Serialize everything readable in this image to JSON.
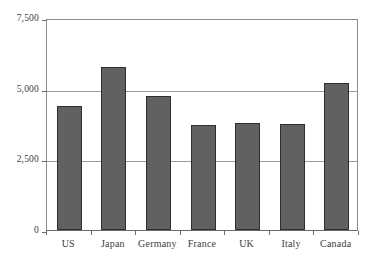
{
  "chart_data": {
    "type": "bar",
    "title": "",
    "subtitle": "",
    "xlabel": "",
    "ylabel": "",
    "categories": [
      "US",
      "Japan",
      "Germany",
      "France",
      "UK",
      "Italy",
      "Canada"
    ],
    "values": [
      4400,
      5750,
      4750,
      3700,
      3800,
      3750,
      5200
    ],
    "series": [
      {
        "name": "",
        "values": [
          4400,
          5750,
          4750,
          3700,
          3800,
          3750,
          5200
        ]
      }
    ],
    "ylim": [
      0,
      7500
    ],
    "yticks": [
      0,
      2500,
      5000,
      7500
    ],
    "ytick_labels": [
      "0",
      "2,500",
      "5,000",
      "7,500"
    ],
    "grid": true,
    "grid_axis": "y",
    "legend": false,
    "legend_position": "none",
    "bar_color": "#616161",
    "bar_border_color": "#2e2e2e",
    "gridline_color": "#9a9a9a",
    "axis_color": "#6a6a6a",
    "text_color": "#3d3d3d",
    "background_color": "#ffffff",
    "annotations": []
  }
}
